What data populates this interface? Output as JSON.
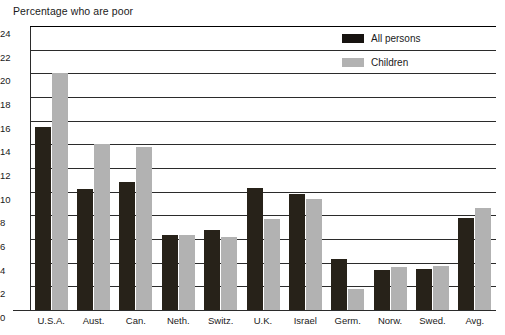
{
  "chart_data": {
    "type": "bar",
    "title": "Percentage who are poor",
    "xlabel": "",
    "ylabel": "",
    "ylim": [
      0,
      24
    ],
    "ytick_step": 2,
    "yticks": [
      "24",
      "22",
      "20",
      "18",
      "16",
      "14",
      "12",
      "10",
      "8",
      "6",
      "4",
      "2",
      "0"
    ],
    "grid": true,
    "legend_position": "top-right",
    "categories": [
      "U.S.A.",
      "Aust.",
      "Can.",
      "Neth.",
      "Switz.",
      "U.K.",
      "Israel",
      "Germ.",
      "Norw.",
      "Swed.",
      "Avg."
    ],
    "series": [
      {
        "name": "All persons",
        "color": "#272219",
        "values": [
          15.5,
          10.2,
          10.8,
          6.3,
          6.8,
          10.3,
          9.8,
          4.3,
          3.4,
          3.5,
          7.8
        ]
      },
      {
        "name": "Children",
        "color": "#b2b2b2",
        "values": [
          20.0,
          14.0,
          13.8,
          6.3,
          6.2,
          7.7,
          9.4,
          1.8,
          3.6,
          3.7,
          8.6
        ]
      }
    ]
  },
  "legend": {
    "items": [
      {
        "label": "All persons",
        "swatch": "dark"
      },
      {
        "label": "Children",
        "swatch": "light"
      }
    ]
  }
}
